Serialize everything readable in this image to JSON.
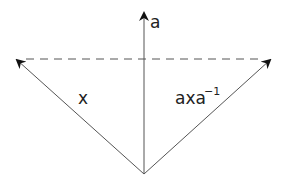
{
  "diagram": {
    "type": "vector-conjugation",
    "colors": {
      "stroke": "#555555",
      "arrowhead": "#111111",
      "text": "#222222",
      "background": "#ffffff"
    },
    "origin": [
      144,
      174
    ],
    "vectors": [
      {
        "id": "a",
        "label": "a",
        "tip": [
          144,
          12
        ],
        "style": "solid"
      },
      {
        "id": "x",
        "label": "x",
        "tip": [
          16,
          59
        ],
        "style": "solid"
      },
      {
        "id": "axa_inv",
        "label": "axa",
        "superscript": "−1",
        "tip": [
          271,
          59
        ],
        "style": "solid"
      }
    ],
    "dashed_line": {
      "from": [
        16,
        59
      ],
      "to": [
        271,
        59
      ]
    }
  },
  "labels": {
    "a": "a",
    "x": "x",
    "axa_base": "axa",
    "axa_sup": "−1"
  }
}
